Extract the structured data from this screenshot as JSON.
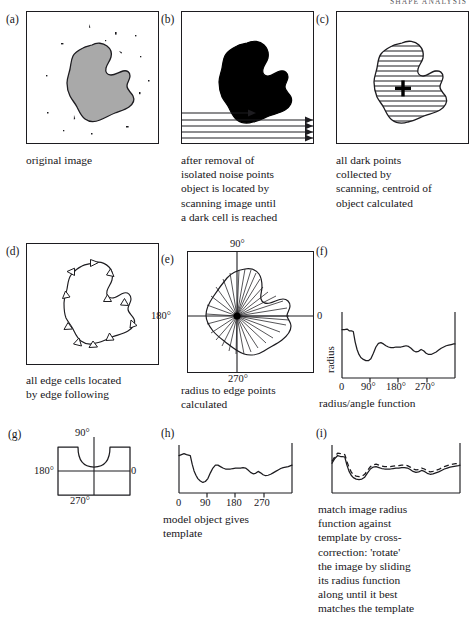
{
  "header": {
    "running_head": "SHAPE ANALYSIS"
  },
  "panels": [
    {
      "id": "a",
      "label": "(a)",
      "caption": "original image"
    },
    {
      "id": "b",
      "label": "(b)",
      "caption": "after removal of\nisolated noise points\nobject is located by\nscanning image until\na dark cell is reached"
    },
    {
      "id": "c",
      "label": "(c)",
      "caption": "all dark points\ncollected by\nscanning, centroid of\nobject calculated"
    },
    {
      "id": "d",
      "label": "(d)",
      "caption": "all edge cells located\nby edge following"
    },
    {
      "id": "e",
      "label": "(e)",
      "caption": "radius to edge points\ncalculated",
      "axis_labels": {
        "top": "90°",
        "left": "180°",
        "right": "0",
        "bottom": "270°"
      }
    },
    {
      "id": "f",
      "label": "(f)",
      "caption": "radius/angle function",
      "ylabel": "radius",
      "ticks": [
        "0",
        "90°",
        "180°",
        "270°"
      ]
    },
    {
      "id": "g",
      "label": "(g)",
      "caption": "",
      "axis_labels": {
        "top": "90°",
        "left": "180°",
        "right": "0",
        "bottom": "270°"
      }
    },
    {
      "id": "h",
      "label": "(h)",
      "caption": "model object gives\ntemplate",
      "ticks": [
        "0",
        "90",
        "180",
        "270"
      ]
    },
    {
      "id": "i",
      "label": "(i)",
      "caption": "match image radius\nfunction against\ntemplate by cross-\ncorrection: 'rotate'\nthe image by sliding\nits radius function\nalong until it best\nmatches the template"
    }
  ],
  "chart_data": [
    {
      "id": "f",
      "type": "line",
      "title": "radius/angle function",
      "xlabel": "",
      "ylabel": "radius",
      "xticks": [
        0,
        90,
        180,
        270
      ],
      "xticklabels": [
        "0",
        "90°",
        "180°",
        "270°"
      ],
      "xlim": [
        0,
        360
      ],
      "ylim": [
        0,
        1
      ],
      "grid": false,
      "legend": "none",
      "x": [
        0,
        8,
        16,
        24,
        30,
        36,
        42,
        48,
        54,
        60,
        68,
        76,
        84,
        92,
        100,
        108,
        116,
        124,
        132,
        140,
        148,
        156,
        164,
        172,
        180,
        188,
        196,
        204,
        212,
        220,
        228,
        236,
        244,
        252,
        260,
        268,
        276,
        284,
        292,
        300,
        308,
        316,
        324,
        332,
        340,
        348,
        356,
        360
      ],
      "y": [
        0.78,
        0.78,
        0.79,
        0.76,
        0.76,
        0.75,
        0.58,
        0.46,
        0.38,
        0.33,
        0.3,
        0.28,
        0.28,
        0.31,
        0.4,
        0.5,
        0.56,
        0.57,
        0.55,
        0.52,
        0.5,
        0.49,
        0.49,
        0.5,
        0.5,
        0.5,
        0.51,
        0.52,
        0.51,
        0.48,
        0.44,
        0.42,
        0.43,
        0.46,
        0.44,
        0.4,
        0.38,
        0.38,
        0.4,
        0.42,
        0.45,
        0.48,
        0.5,
        0.52,
        0.53,
        0.54,
        0.55,
        0.55
      ]
    },
    {
      "id": "h",
      "type": "line",
      "title": "model object gives template",
      "xlabel": "",
      "ylabel": "",
      "xticks": [
        0,
        90,
        180,
        270
      ],
      "xticklabels": [
        "0",
        "90",
        "180",
        "270"
      ],
      "xlim": [
        0,
        360
      ],
      "ylim": [
        0,
        1
      ],
      "grid": false,
      "legend": "none",
      "x": [
        0,
        8,
        16,
        24,
        30,
        36,
        42,
        48,
        54,
        60,
        68,
        76,
        84,
        92,
        100,
        108,
        116,
        124,
        132,
        140,
        148,
        156,
        164,
        172,
        180,
        188,
        196,
        204,
        212,
        220,
        228,
        236,
        244,
        252,
        260,
        268,
        276,
        284,
        292,
        300,
        308,
        316,
        324,
        332,
        340,
        348,
        356,
        360
      ],
      "y": [
        0.78,
        0.8,
        0.82,
        0.8,
        0.79,
        0.78,
        0.6,
        0.46,
        0.37,
        0.3,
        0.25,
        0.22,
        0.24,
        0.3,
        0.42,
        0.52,
        0.58,
        0.58,
        0.55,
        0.52,
        0.5,
        0.5,
        0.5,
        0.51,
        0.52,
        0.52,
        0.52,
        0.53,
        0.52,
        0.48,
        0.43,
        0.4,
        0.41,
        0.45,
        0.42,
        0.38,
        0.36,
        0.37,
        0.39,
        0.42,
        0.45,
        0.48,
        0.51,
        0.53,
        0.54,
        0.55,
        0.57,
        0.58
      ]
    },
    {
      "id": "i",
      "type": "line",
      "title": "match image radius function against template",
      "xlabel": "",
      "ylabel": "",
      "xlim": [
        0,
        360
      ],
      "ylim": [
        0,
        1
      ],
      "grid": false,
      "legend": "none",
      "series": [
        {
          "name": "image radius function",
          "style": "solid",
          "x": [
            0,
            8,
            16,
            24,
            30,
            36,
            42,
            48,
            54,
            60,
            68,
            76,
            84,
            92,
            100,
            108,
            116,
            124,
            132,
            140,
            148,
            156,
            164,
            172,
            180,
            188,
            196,
            204,
            212,
            220,
            228,
            236,
            244,
            252,
            260,
            268,
            276,
            284,
            292,
            300,
            308,
            316,
            324,
            332,
            340,
            348,
            356,
            360
          ],
          "y": [
            0.62,
            0.72,
            0.78,
            0.76,
            0.76,
            0.75,
            0.58,
            0.45,
            0.37,
            0.32,
            0.29,
            0.28,
            0.29,
            0.33,
            0.42,
            0.5,
            0.54,
            0.55,
            0.53,
            0.51,
            0.5,
            0.5,
            0.5,
            0.51,
            0.52,
            0.52,
            0.53,
            0.53,
            0.52,
            0.49,
            0.45,
            0.43,
            0.44,
            0.47,
            0.45,
            0.41,
            0.39,
            0.4,
            0.42,
            0.44,
            0.47,
            0.5,
            0.52,
            0.54,
            0.55,
            0.56,
            0.57,
            0.58
          ]
        },
        {
          "name": "template",
          "style": "dashed",
          "x": [
            0,
            8,
            16,
            24,
            30,
            36,
            42,
            48,
            54,
            60,
            68,
            76,
            84,
            92,
            100,
            108,
            116,
            124,
            132,
            140,
            148,
            156,
            164,
            172,
            180,
            188,
            196,
            204,
            212,
            220,
            228,
            236,
            244,
            252,
            260,
            268,
            276,
            284,
            292,
            300,
            308,
            316,
            324,
            332,
            340,
            348,
            356,
            360
          ],
          "y": [
            0.66,
            0.76,
            0.83,
            0.82,
            0.81,
            0.8,
            0.66,
            0.53,
            0.44,
            0.38,
            0.35,
            0.34,
            0.35,
            0.39,
            0.47,
            0.55,
            0.59,
            0.6,
            0.58,
            0.56,
            0.55,
            0.55,
            0.55,
            0.56,
            0.57,
            0.57,
            0.58,
            0.58,
            0.57,
            0.54,
            0.5,
            0.48,
            0.49,
            0.52,
            0.5,
            0.46,
            0.44,
            0.45,
            0.47,
            0.49,
            0.52,
            0.55,
            0.57,
            0.59,
            0.6,
            0.61,
            0.62,
            0.63
          ]
        }
      ]
    }
  ],
  "colors": {
    "ink": "#17161a",
    "object_fill_gray": "#a9a9a9",
    "object_fill_black": "#000000",
    "paper": "#ffffff"
  }
}
